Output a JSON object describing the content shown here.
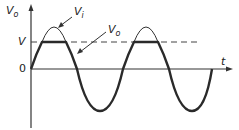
{
  "diagram": {
    "type": "clipper-waveform",
    "y_axis_label": "V",
    "y_axis_label_sub": "o",
    "x_axis_label": "t",
    "level_label": "V",
    "origin_label": "0",
    "input_label": "V",
    "input_label_sub": "i",
    "output_label": "V",
    "output_label_sub": "o",
    "colors": {
      "stroke": "#2a2a2a",
      "background": "#ffffff"
    }
  }
}
